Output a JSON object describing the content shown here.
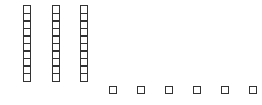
{
  "figure": {
    "type": "base-ten blocks",
    "stroke_color": "#333333",
    "background": "#ffffff"
  },
  "tens": {
    "count": 3,
    "cells_per_rod": 10,
    "rods": [
      {
        "x": 23
      },
      {
        "x": 52
      },
      {
        "x": 80
      }
    ]
  },
  "ones": {
    "count": 6,
    "units": [
      {
        "x": 109
      },
      {
        "x": 137
      },
      {
        "x": 165
      },
      {
        "x": 193
      },
      {
        "x": 221
      },
      {
        "x": 249
      }
    ]
  }
}
